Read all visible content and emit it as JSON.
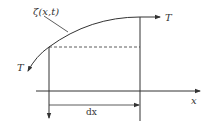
{
  "diagram": {
    "title": "",
    "type": "string element tension diagram",
    "labels": {
      "curve_label": "ζ(x,t)",
      "tension_right": "T",
      "tension_left": "T",
      "x_axis": "x",
      "interval": "dx"
    },
    "colors": {
      "stroke": "#333333",
      "background": "#ffffff"
    },
    "elements": {
      "curve": "displacement curve ζ(x,t) with tension arrows at both ends",
      "dashed_line": "horizontal reference line from left end of element",
      "verticals": [
        "left vertical line at x",
        "right vertical line at x+dx"
      ],
      "axis": "horizontal x-axis with arrow",
      "dimension": "dx span between verticals"
    }
  }
}
